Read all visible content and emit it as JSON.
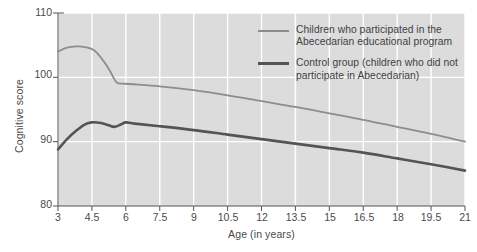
{
  "chart_data": {
    "type": "line",
    "title": "",
    "xlabel": "Age (in years)",
    "ylabel": "Cognitive score",
    "xlim": [
      3,
      21
    ],
    "ylim": [
      80,
      110
    ],
    "grid": true,
    "x_ticks": [
      3,
      4.5,
      6,
      7.5,
      9,
      10.5,
      12,
      13.5,
      15,
      16.5,
      18,
      19.5,
      21
    ],
    "x_tick_labels": [
      "3",
      "4.5",
      "6",
      "7.5",
      "9",
      "10.5",
      "12",
      "13.5",
      "15",
      "16.5",
      "18",
      "19.5",
      "21"
    ],
    "y_ticks": [
      80,
      90,
      100,
      110
    ],
    "y_tick_labels": [
      "80",
      "90",
      "100",
      "110"
    ],
    "legend_position": "inside top-right",
    "series": [
      {
        "name": "Children who participated in the Abecedarian educational program",
        "color": "#8d8d8d",
        "line_width": 1.8,
        "x": [
          3,
          3.4,
          3.8,
          4.2,
          4.6,
          5.0,
          5.3,
          5.6,
          6.0,
          7.5,
          9,
          10.5,
          12,
          13.5,
          15,
          16.5,
          18,
          19.5,
          21
        ],
        "values": [
          104.0,
          104.6,
          104.8,
          104.7,
          104.2,
          102.6,
          101.0,
          99.2,
          99.0,
          98.6,
          98.0,
          97.2,
          96.3,
          95.4,
          94.4,
          93.4,
          92.3,
          91.2,
          90.0
        ]
      },
      {
        "name": "Control group (children who did not participate in Abecedarian)",
        "color": "#545454",
        "line_width": 2.6,
        "x": [
          3,
          3.4,
          3.8,
          4.2,
          4.5,
          4.9,
          5.2,
          5.5,
          5.8,
          6.0,
          6.4,
          7.5,
          9,
          10.5,
          12,
          13.5,
          15,
          16.5,
          18,
          19.5,
          21
        ],
        "values": [
          88.8,
          90.4,
          91.7,
          92.7,
          93.0,
          92.9,
          92.6,
          92.3,
          92.7,
          93.0,
          92.8,
          92.4,
          91.8,
          91.1,
          90.4,
          89.7,
          89.0,
          88.3,
          87.4,
          86.5,
          85.5
        ]
      }
    ]
  },
  "axes": {
    "y_title": "Cognitive score",
    "x_title": "Age (in years)"
  },
  "legend": {
    "entries": [
      {
        "swatch": "treatment-line-swatch",
        "label_line1": "Children who participated in the",
        "label_line2": "Abecedarian educational program"
      },
      {
        "swatch": "control-line-swatch",
        "label_line1": "Control group (children who did not",
        "label_line2": "participate in Abecedarian)"
      }
    ]
  },
  "style": {
    "plot_background": "#dcdcdc",
    "gridline_color": "#ffffff",
    "axis_color": "#555555",
    "treatment_color": "#8d8d8d",
    "control_color": "#545454"
  }
}
